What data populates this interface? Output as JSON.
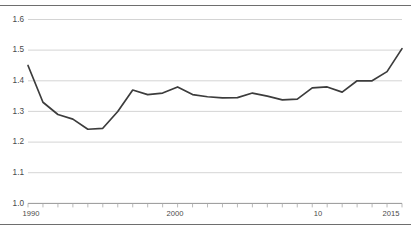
{
  "chart_data": {
    "type": "line",
    "title": "",
    "subtitle": "",
    "xlabel": "",
    "ylabel": "",
    "xlim": [
      1990,
      2015
    ],
    "ylim": [
      1.0,
      1.6
    ],
    "grid": true,
    "legend": null,
    "y_ticks": [
      1.0,
      1.1,
      1.2,
      1.3,
      1.4,
      1.5,
      1.6
    ],
    "y_tick_labels": [
      "1.0",
      "1.1",
      "1.2",
      "1.3",
      "1.4",
      "1.5",
      "1.6"
    ],
    "x_ticks": [
      1990,
      1991,
      1992,
      1993,
      1994,
      1995,
      1996,
      1997,
      1998,
      1999,
      2000,
      2001,
      2002,
      2003,
      2004,
      2005,
      2006,
      2007,
      2008,
      2009,
      2010,
      2011,
      2012,
      2013,
      2014,
      2015
    ],
    "x_tick_labels": [
      "1990",
      "2000",
      "10",
      "2015"
    ],
    "x_labeled_ticks": [
      1990,
      2000,
      2010,
      2015
    ],
    "x": [
      1990,
      1991,
      1992,
      1993,
      1994,
      1995,
      1996,
      1997,
      1998,
      1999,
      2000,
      2001,
      2002,
      2003,
      2004,
      2005,
      2006,
      2007,
      2008,
      2009,
      2010,
      2011,
      2012,
      2013,
      2014,
      2015
    ],
    "values": [
      1.45,
      1.33,
      1.29,
      1.275,
      1.242,
      1.245,
      1.3,
      1.37,
      1.355,
      1.36,
      1.38,
      1.355,
      1.348,
      1.344,
      1.345,
      1.36,
      1.35,
      1.338,
      1.34,
      1.377,
      1.38,
      1.363,
      1.4,
      1.4,
      1.43,
      1.505
    ],
    "series": [
      {
        "name": "series-1",
        "color": "#3c3c3c",
        "values": [
          1.45,
          1.33,
          1.29,
          1.275,
          1.242,
          1.245,
          1.3,
          1.37,
          1.355,
          1.36,
          1.38,
          1.355,
          1.348,
          1.344,
          1.345,
          1.36,
          1.35,
          1.338,
          1.34,
          1.377,
          1.38,
          1.363,
          1.4,
          1.4,
          1.43,
          1.505
        ]
      }
    ],
    "colors": {
      "series": "#3c3c3c",
      "grid": "#c9c9c9",
      "axis": "#8a8a8a",
      "text": "#4a4a4a",
      "rule": "#6e6e6e",
      "background": "#ffffff"
    }
  },
  "axis": {
    "y_label_1_6": "1.6",
    "y_label_1_5": "1.5",
    "y_label_1_4": "1.4",
    "y_label_1_3": "1.3",
    "y_label_1_2": "1.2",
    "y_label_1_1": "1.1",
    "y_label_1_0": "1.0",
    "x_label_start": "1990",
    "x_label_mid": "2000",
    "x_label_decade": "10",
    "x_label_end": "2015"
  }
}
